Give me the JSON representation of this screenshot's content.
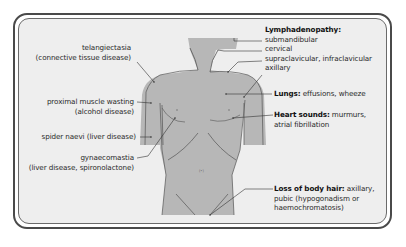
{
  "colors": {
    "background": "#eeeeee",
    "body_fill": "#b7b7b7",
    "outline": "#555555",
    "frame": "#4a4a4a",
    "text": "#2a2a2a"
  },
  "left_labels": {
    "telangiectasia": {
      "line1": "telangiectasia",
      "line2": "(connective tissue disease)"
    },
    "proximal": {
      "line1": "proximal muscle wasting",
      "line2": "(alcohol disease)"
    },
    "spider": {
      "line1": "spider naevi (liver disease)"
    },
    "gynaecomastia": {
      "line1": "gynaecomastia",
      "line2": "(liver disease, spironolactone)"
    }
  },
  "right_labels": {
    "lymph": {
      "title": "Lymphadenopathy:",
      "items": [
        "submandibular",
        "cervical",
        "supraclavicular, infraclavicular",
        "axillary"
      ]
    },
    "lungs": {
      "title": "Lungs:",
      "text": " effusions, wheeze"
    },
    "heart": {
      "title": "Heart sounds:",
      "text": " murmurs,",
      "line2": "atrial fibrillation"
    },
    "hair": {
      "title": "Loss of body hair:",
      "text": " axillary,",
      "line2": "pubic (hypogonadism or",
      "line3": "haemochromatosis)"
    }
  }
}
